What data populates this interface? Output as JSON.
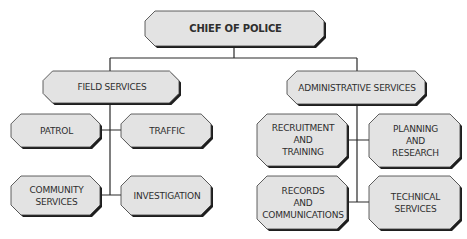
{
  "diagram": {
    "type": "org-chart",
    "colors": {
      "box_fill": "#e3e3e3",
      "box_border": "#3a3a3a",
      "shadow": "#1e1e1e",
      "text": "#2e2e2e",
      "connector": "#2a2a2a"
    },
    "nodes": [
      {
        "id": "chief",
        "lines": [
          "CHIEF OF POLICE"
        ],
        "x": 145,
        "y": 11,
        "w": 179,
        "h": 35,
        "big": true
      },
      {
        "id": "field",
        "lines": [
          "FIELD SERVICES"
        ],
        "x": 43,
        "y": 71,
        "w": 136,
        "h": 32
      },
      {
        "id": "admin",
        "lines": [
          "ADMINISTRATIVE SERVICES"
        ],
        "x": 287,
        "y": 71,
        "w": 138,
        "h": 33
      },
      {
        "id": "patrol",
        "lines": [
          "PATROL"
        ],
        "x": 11,
        "y": 114,
        "w": 89,
        "h": 33
      },
      {
        "id": "traffic",
        "lines": [
          "TRAFFIC"
        ],
        "x": 121,
        "y": 114,
        "w": 90,
        "h": 33
      },
      {
        "id": "community",
        "lines": [
          "COMMUNITY",
          "SERVICES"
        ],
        "x": 11,
        "y": 176,
        "w": 89,
        "h": 39
      },
      {
        "id": "investigation",
        "lines": [
          "INVESTIGATION"
        ],
        "x": 121,
        "y": 176,
        "w": 90,
        "h": 39
      },
      {
        "id": "recruitment",
        "lines": [
          "RECRUITMENT",
          "AND",
          "TRAINING"
        ],
        "x": 257,
        "y": 114,
        "w": 90,
        "h": 52
      },
      {
        "id": "planning",
        "lines": [
          "PLANNING",
          "AND",
          "RESEARCH"
        ],
        "x": 369,
        "y": 114,
        "w": 91,
        "h": 53
      },
      {
        "id": "records",
        "lines": [
          "RECORDS",
          "AND",
          "COMMUNICATIONS"
        ],
        "x": 257,
        "y": 176,
        "w": 90,
        "h": 53
      },
      {
        "id": "technical",
        "lines": [
          "TECHNICAL",
          "SERVICES"
        ],
        "x": 369,
        "y": 176,
        "w": 91,
        "h": 53
      }
    ],
    "edges": [
      {
        "from": "chief",
        "to": "field"
      },
      {
        "from": "chief",
        "to": "admin"
      },
      {
        "from": "field",
        "to": "patrol"
      },
      {
        "from": "field",
        "to": "traffic"
      },
      {
        "from": "field",
        "to": "community"
      },
      {
        "from": "field",
        "to": "investigation"
      },
      {
        "from": "admin",
        "to": "recruitment"
      },
      {
        "from": "admin",
        "to": "planning"
      },
      {
        "from": "admin",
        "to": "records"
      },
      {
        "from": "admin",
        "to": "technical"
      }
    ],
    "connectors": [
      {
        "d": "M234 46 L234 58 M110 58 L357 58 M110 58 L110 71 M357 58 L357 71"
      },
      {
        "d": "M110 103 L110 195 M100 130 L121 130 M100 195 L121 195"
      },
      {
        "d": "M357 104 L357 202 M347 140 L369 140 M347 202 L369 202"
      }
    ]
  }
}
